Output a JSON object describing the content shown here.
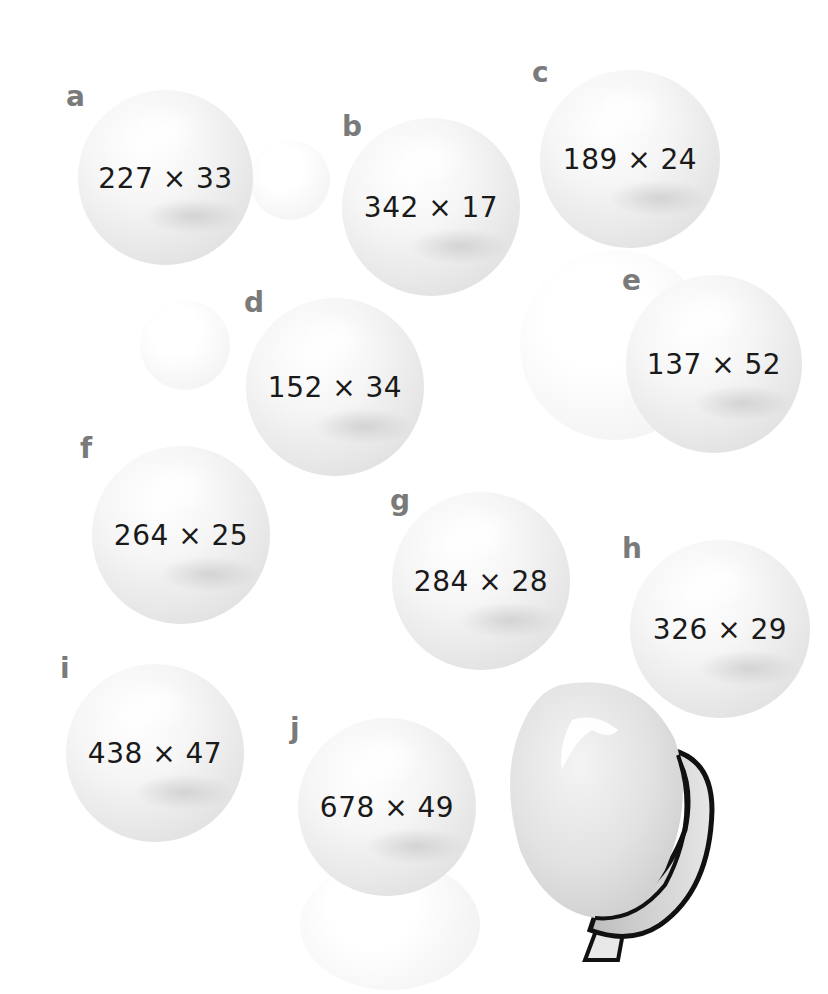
{
  "problems": [
    {
      "label": "a",
      "expression": "227 × 33"
    },
    {
      "label": "b",
      "expression": "342 × 17"
    },
    {
      "label": "c",
      "expression": "189 × 24"
    },
    {
      "label": "d",
      "expression": "152 × 34"
    },
    {
      "label": "e",
      "expression": "137 × 52"
    },
    {
      "label": "f",
      "expression": "264 × 25"
    },
    {
      "label": "g",
      "expression": "284 × 28"
    },
    {
      "label": "h",
      "expression": "326 × 29"
    },
    {
      "label": "i",
      "expression": "438 × 47"
    },
    {
      "label": "j",
      "expression": "678 × 49"
    }
  ],
  "colors": {
    "label": "#7a7a7a",
    "text": "#1a1a1a",
    "bubble": "#eeeeee",
    "outline": "#111111"
  }
}
